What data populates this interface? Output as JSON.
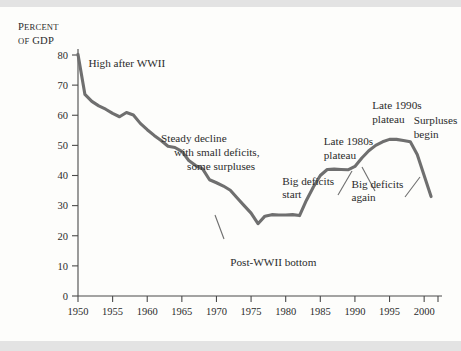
{
  "figure": {
    "background_color": "#fdfdfb",
    "band_color": "#e3e3e3",
    "curve_color": "#6f6f6f",
    "axis_color": "#4a4a4a",
    "text_color": "#2b2b2b"
  },
  "axis_title": {
    "line1_cap": "P",
    "line1_rest": "ERCENT",
    "line2_cap": "OF",
    "line2_rest": " GDP"
  },
  "chart_data": {
    "type": "line",
    "title": "",
    "subtitle": "",
    "xlabel": "",
    "ylabel": "Percent of GDP",
    "xlim": [
      1950,
      2002
    ],
    "ylim": [
      0,
      80
    ],
    "grid": false,
    "legend": "none",
    "xticks": [
      1950,
      1955,
      1960,
      1965,
      1970,
      1975,
      1980,
      1985,
      1990,
      1995,
      2000
    ],
    "xticklabels": [
      "1950",
      "1955",
      "1960",
      "1965",
      "1970",
      "1975",
      "1980",
      "1985",
      "1990",
      "1995",
      "2000"
    ],
    "extra_xtick": 2002,
    "yticks": [
      0,
      10,
      20,
      30,
      40,
      50,
      60,
      70,
      80
    ],
    "yticklabels": [
      "0",
      "10",
      "20",
      "30",
      "40",
      "50",
      "60",
      "70",
      "80"
    ],
    "series": [
      {
        "name": "Federal debt held by the public as percent of GDP",
        "x": [
          1950,
          1951,
          1952,
          1953,
          1954,
          1955,
          1956,
          1957,
          1958,
          1959,
          1960,
          1961,
          1962,
          1963,
          1964,
          1965,
          1966,
          1967,
          1968,
          1969,
          1970,
          1971,
          1972,
          1973,
          1974,
          1975,
          1976,
          1977,
          1978,
          1979,
          1980,
          1981,
          1982,
          1983,
          1984,
          1985,
          1986,
          1987,
          1988,
          1989,
          1990,
          1991,
          1992,
          1993,
          1994,
          1995,
          1996,
          1997,
          1998,
          1999,
          2000,
          2001
        ],
        "y": [
          80.2,
          66.9,
          64.6,
          63.1,
          62.0,
          60.6,
          59.5,
          60.9,
          60.1,
          57.3,
          55.2,
          53.3,
          51.6,
          49.7,
          49.3,
          48.0,
          45.0,
          43.3,
          42.2,
          38.6,
          37.6,
          36.5,
          35.1,
          32.5,
          30.0,
          27.5,
          24.0,
          26.5,
          27.0,
          26.9,
          26.9,
          27.0,
          26.7,
          31.8,
          36.2,
          40.0,
          42.0,
          42.1,
          42.0,
          41.9,
          43.0,
          45.8,
          48.2,
          50.0,
          51.2,
          52.0,
          52.0,
          51.6,
          51.2,
          47.0,
          40.0,
          33.0
        ]
      }
    ],
    "annotations": [
      {
        "id": "high-after-wwii",
        "lines": [
          "High after WWII"
        ],
        "x": 1951.5,
        "y": 76,
        "align": "start",
        "leader": false
      },
      {
        "id": "steady-decline",
        "lines": [
          "Steady decline",
          "with small deficits,",
          "some surpluses"
        ],
        "x": 1962,
        "y": 51,
        "align": "start",
        "leader": false
      },
      {
        "id": "post-wwii-bottom",
        "lines": [
          "Post-WWII bottom"
        ],
        "x": 1972,
        "y": 10,
        "align": "start",
        "leader": true
      },
      {
        "id": "big-deficits-start",
        "lines": [
          "Big deficits",
          "start"
        ],
        "x": 1979.5,
        "y": 37,
        "align": "start",
        "leader": false
      },
      {
        "id": "late-1980s-plateau",
        "lines": [
          "Late 1980s",
          "plateau"
        ],
        "x": 1985.5,
        "y": 50,
        "align": "start",
        "leader": false
      },
      {
        "id": "big-deficits-again",
        "lines": [
          "Big deficits",
          "again"
        ],
        "x": 1989.5,
        "y": 36,
        "align": "start",
        "leader": true
      },
      {
        "id": "late-1990s-plateau",
        "lines": [
          "Late 1990s",
          "plateau"
        ],
        "x": 1992.5,
        "y": 62,
        "align": "start",
        "leader": true
      },
      {
        "id": "surpluses-begin",
        "lines": [
          "Surpluses",
          "begin"
        ],
        "x": 1998.5,
        "y": 57,
        "align": "start",
        "leader": true
      }
    ]
  }
}
